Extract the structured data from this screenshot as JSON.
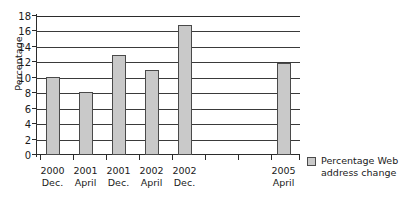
{
  "chart_data": {
    "type": "bar",
    "title": "",
    "subtitle": "",
    "xlabel": "",
    "ylabel": "Percentage",
    "ylim": [
      0,
      18
    ],
    "ytick_step": 2,
    "yticks": [
      0,
      2,
      4,
      6,
      8,
      10,
      12,
      14,
      16,
      18
    ],
    "grid": true,
    "grid_axis": "y",
    "legend_position": "right",
    "categories": [
      "2000\nDec.",
      "2001\nApril",
      "2001\nDec.",
      "2002\nApril",
      "2002\nDec.",
      "",
      "",
      "2005\nApril"
    ],
    "category_labels": [
      {
        "year": "2000",
        "month": "Dec."
      },
      {
        "year": "2001",
        "month": "April"
      },
      {
        "year": "2001",
        "month": "Dec."
      },
      {
        "year": "2002",
        "month": "April"
      },
      {
        "year": "2002",
        "month": "Dec."
      },
      {
        "year": "",
        "month": ""
      },
      {
        "year": "",
        "month": ""
      },
      {
        "year": "2005",
        "month": "April"
      }
    ],
    "values": [
      10.1,
      8.2,
      12.9,
      11.0,
      16.9,
      null,
      null,
      11.9
    ],
    "series": [
      {
        "name": "Percentage Web address change",
        "values": [
          10.1,
          8.2,
          12.9,
          11.0,
          16.9,
          null,
          null,
          11.9
        ]
      }
    ],
    "legend": [
      {
        "label_line1": "Percentage Web",
        "label_line2": "address change"
      }
    ],
    "colors": {
      "bar_fill": "#c9c9c9",
      "bar_border": "#4a4a4a",
      "grid": "#3a3a3a",
      "axis": "#2b2b2b",
      "text": "#1a1a1a",
      "background": "#ffffff"
    }
  }
}
